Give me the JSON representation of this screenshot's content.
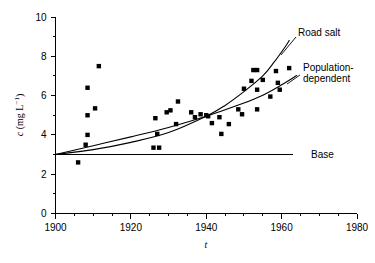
{
  "chart_data": {
    "type": "scatter",
    "title": "",
    "xlabel": "t",
    "ylabel": "c (mg L⁻¹)",
    "xlim": [
      1900,
      1980
    ],
    "ylim": [
      0,
      10
    ],
    "xticks": [
      1900,
      1920,
      1940,
      1960,
      1980
    ],
    "yticks": [
      0,
      2,
      4,
      6,
      8,
      10
    ],
    "x_minor_step": 5,
    "y_minor_step": 1,
    "grid": false,
    "legend_position": "inline-annotations",
    "marker": "filled-square",
    "points": [
      {
        "x": 1906,
        "y": 2.6
      },
      {
        "x": 1908,
        "y": 3.5
      },
      {
        "x": 1908.5,
        "y": 4.0
      },
      {
        "x": 1908.5,
        "y": 5.0
      },
      {
        "x": 1908.5,
        "y": 6.4
      },
      {
        "x": 1910.5,
        "y": 5.35
      },
      {
        "x": 1911.5,
        "y": 7.5
      },
      {
        "x": 1926,
        "y": 3.35
      },
      {
        "x": 1927.5,
        "y": 3.35
      },
      {
        "x": 1927,
        "y": 4.05
      },
      {
        "x": 1926.5,
        "y": 4.85
      },
      {
        "x": 1929.5,
        "y": 5.15
      },
      {
        "x": 1930.5,
        "y": 5.25
      },
      {
        "x": 1932,
        "y": 4.55
      },
      {
        "x": 1932.5,
        "y": 5.7
      },
      {
        "x": 1936,
        "y": 5.15
      },
      {
        "x": 1937,
        "y": 4.9
      },
      {
        "x": 1938.5,
        "y": 5.05
      },
      {
        "x": 1940,
        "y": 5.0
      },
      {
        "x": 1940.5,
        "y": 4.95
      },
      {
        "x": 1941.5,
        "y": 4.6
      },
      {
        "x": 1943.5,
        "y": 4.9
      },
      {
        "x": 1944,
        "y": 4.05
      },
      {
        "x": 1946,
        "y": 4.55
      },
      {
        "x": 1948.5,
        "y": 5.3
      },
      {
        "x": 1949.5,
        "y": 5.05
      },
      {
        "x": 1950,
        "y": 6.35
      },
      {
        "x": 1952,
        "y": 6.75
      },
      {
        "x": 1952.5,
        "y": 7.3
      },
      {
        "x": 1953.5,
        "y": 7.3
      },
      {
        "x": 1953.5,
        "y": 6.3
      },
      {
        "x": 1953.5,
        "y": 5.3
      },
      {
        "x": 1955,
        "y": 6.8
      },
      {
        "x": 1957,
        "y": 5.95
      },
      {
        "x": 1958.5,
        "y": 7.25
      },
      {
        "x": 1959,
        "y": 6.65
      },
      {
        "x": 1959.5,
        "y": 6.3
      },
      {
        "x": 1962,
        "y": 7.4
      }
    ],
    "series": [
      {
        "name": "Road salt",
        "type": "curve",
        "label": "Road salt",
        "points": [
          {
            "x": 1900,
            "y": 3.0
          },
          {
            "x": 1910,
            "y": 3.25
          },
          {
            "x": 1920,
            "y": 3.62
          },
          {
            "x": 1930,
            "y": 4.12
          },
          {
            "x": 1940,
            "y": 4.95
          },
          {
            "x": 1945,
            "y": 5.5
          },
          {
            "x": 1950,
            "y": 6.2
          },
          {
            "x": 1955,
            "y": 7.0
          },
          {
            "x": 1958,
            "y": 7.7
          },
          {
            "x": 1961,
            "y": 8.5
          },
          {
            "x": 1962,
            "y": 8.8
          }
        ]
      },
      {
        "name": "Population-dependent",
        "type": "curve",
        "label": "Population-dependent",
        "points": [
          {
            "x": 1900,
            "y": 3.0
          },
          {
            "x": 1910,
            "y": 3.45
          },
          {
            "x": 1920,
            "y": 3.9
          },
          {
            "x": 1930,
            "y": 4.38
          },
          {
            "x": 1940,
            "y": 4.95
          },
          {
            "x": 1950,
            "y": 5.62
          },
          {
            "x": 1955,
            "y": 6.02
          },
          {
            "x": 1960,
            "y": 6.55
          },
          {
            "x": 1964,
            "y": 7.02
          }
        ]
      },
      {
        "name": "Base",
        "type": "line",
        "label": "Base",
        "points": [
          {
            "x": 1900,
            "y": 3.0
          },
          {
            "x": 1963,
            "y": 3.0
          }
        ]
      }
    ],
    "annotations": [
      {
        "id": "road-salt",
        "text": "Road salt"
      },
      {
        "id": "population-dependent-line1",
        "text": "Population-"
      },
      {
        "id": "population-dependent-line2",
        "text": "dependent"
      },
      {
        "id": "base",
        "text": "Base"
      }
    ]
  },
  "axis": {
    "y_label_main": "c",
    "y_label_units": " (mg L",
    "y_label_sup": "−1",
    "y_label_close": ")",
    "x_label": "t",
    "xtick_labels": [
      "1900",
      "1920",
      "1940",
      "1960",
      "1980"
    ],
    "ytick_labels": [
      "0",
      "2",
      "4",
      "6",
      "8",
      "10"
    ]
  },
  "labels": {
    "road_salt": "Road salt",
    "population_line1": "Population-",
    "population_line2": "dependent",
    "base": "Base"
  },
  "colors": {
    "ink": "#000000",
    "background": "#ffffff"
  }
}
